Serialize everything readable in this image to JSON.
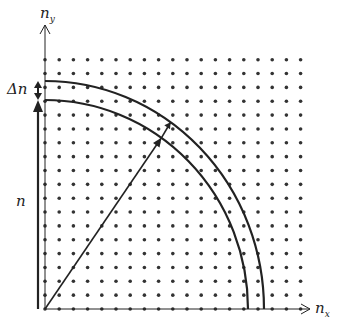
{
  "labels": {
    "y_axis": "n",
    "y_axis_sub": "y",
    "x_axis": "n",
    "x_axis_sub": "x",
    "delta_n": "Δn",
    "radius_n": "n"
  },
  "geometry": {
    "origin": [
      45,
      309
    ],
    "grid_cols": 19,
    "grid_rows": 19,
    "dx": 14.2,
    "dy": 13.85,
    "inner_radius": [
      203,
      209
    ],
    "outer_radius": [
      219,
      228
    ]
  },
  "colors": {
    "ink": "#222222",
    "dot": "#333333"
  }
}
